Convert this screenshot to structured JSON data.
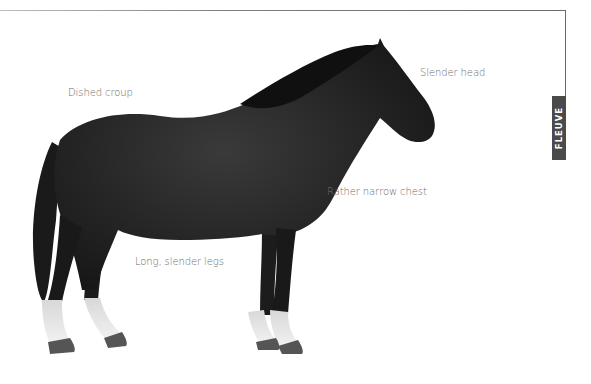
{
  "page": {
    "section_tab": "FLEUVE",
    "annotations": [
      {
        "id": "croup",
        "text": "Dished croup"
      },
      {
        "id": "head",
        "text": "Slender head"
      },
      {
        "id": "chest",
        "text": "Rather narrow chest"
      },
      {
        "id": "legs",
        "text": "Long, slender legs"
      }
    ]
  },
  "illustration": {
    "subject": "horse-profile",
    "coat_color": "#1e1e1e",
    "sock_color": "#e6e6e6",
    "hoof_color": "#555555"
  }
}
